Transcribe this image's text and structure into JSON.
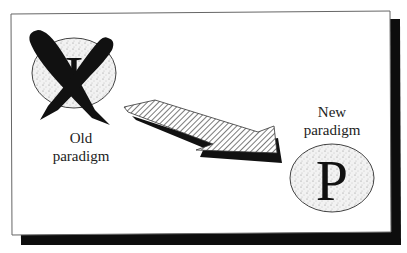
{
  "diagram": {
    "type": "paradigm-shift",
    "old": {
      "glyph": "I",
      "label_line1": "Old",
      "label_line2": "paradigm",
      "crossed_out": true
    },
    "new": {
      "glyph": "P",
      "label_line1": "New",
      "label_line2": "paradigm"
    },
    "arrow": {
      "direction": "old-to-new",
      "fill": "hatched"
    }
  },
  "colors": {
    "ink": "#111111",
    "frame": "#555555",
    "shadow": "#0d0d0d",
    "stipple_bg": "#eeeeee",
    "paper": "#ffffff"
  }
}
